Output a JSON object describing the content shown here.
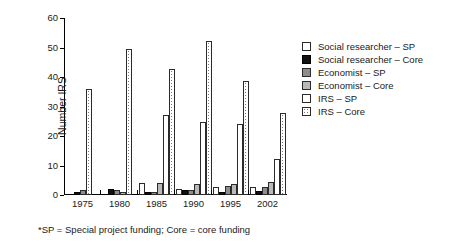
{
  "chart_data": {
    "type": "bar",
    "title": "",
    "xlabel": "",
    "ylabel": "Number IRS",
    "ylim": [
      0,
      60
    ],
    "yticks": [
      0,
      10,
      20,
      30,
      40,
      50,
      60
    ],
    "grid": false,
    "legend_position": "right",
    "categories": [
      "1975",
      "1980",
      "1985",
      "1990",
      "1995",
      "2002"
    ],
    "series": [
      {
        "name": "Social researcher – SP",
        "key": "sr-sp",
        "values": [
          0,
          0,
          4,
          2,
          2.8,
          2.6
        ]
      },
      {
        "name": "Social researcher – Core",
        "key": "sr-core",
        "values": [
          1,
          2,
          1,
          1.8,
          1,
          1.5
        ]
      },
      {
        "name": "Economist – SP",
        "key": "ec-sp",
        "values": [
          1.8,
          1.8,
          1,
          1.7,
          3,
          2.6
        ]
      },
      {
        "name": "Economist – Core",
        "key": "ec-core",
        "values": [
          0,
          1,
          4,
          3.8,
          3.8,
          4.5
        ]
      },
      {
        "name": "IRS – SP",
        "key": "irs-sp",
        "values": [
          0,
          0,
          27,
          24.8,
          24.2,
          12.3
        ]
      },
      {
        "name": "IRS – Core",
        "key": "irs-core",
        "values": [
          36,
          49.5,
          42.8,
          52.3,
          38.6,
          27.8
        ]
      }
    ],
    "footnote": "*SP = Special project funding; Core = core funding"
  }
}
